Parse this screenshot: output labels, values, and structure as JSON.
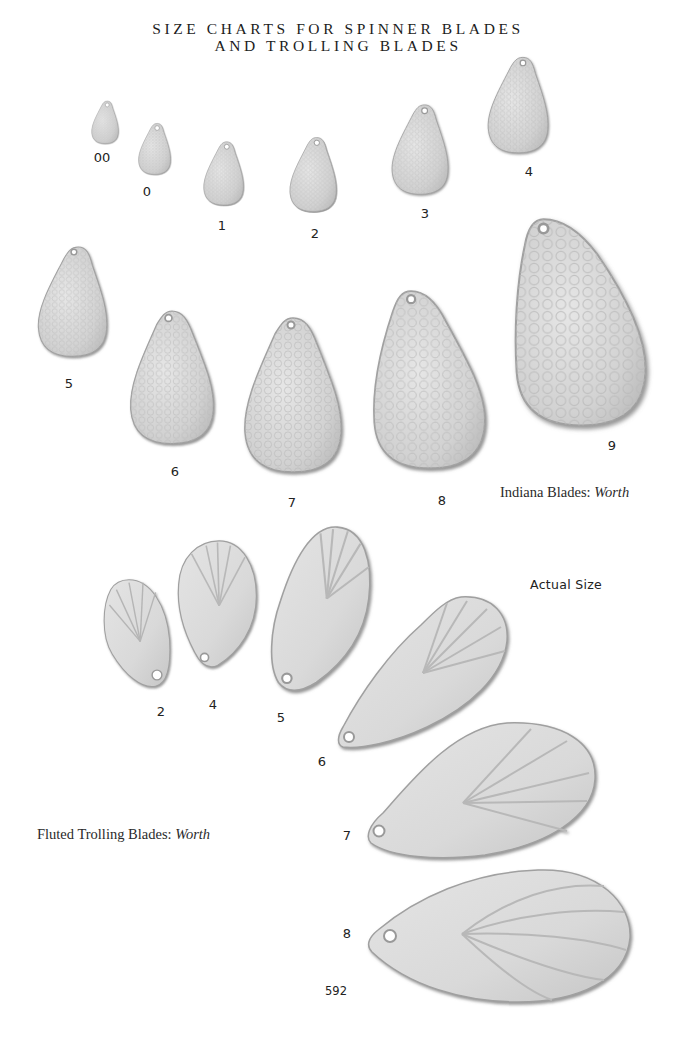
{
  "page": {
    "title_line1": "SIZE CHARTS FOR SPINNER BLADES",
    "title_line2": "AND TROLLING BLADES",
    "page_number": "592",
    "actual_size_note": "Actual Size"
  },
  "indiana_blades": {
    "caption_prefix": "Indiana Blades: ",
    "caption_maker": "Worth",
    "finish": "hammered",
    "sizes": [
      {
        "label": "00"
      },
      {
        "label": "0"
      },
      {
        "label": "1"
      },
      {
        "label": "2"
      },
      {
        "label": "3"
      },
      {
        "label": "4"
      },
      {
        "label": "5"
      },
      {
        "label": "6"
      },
      {
        "label": "7"
      },
      {
        "label": "8"
      },
      {
        "label": "9"
      }
    ]
  },
  "fluted_trolling_blades": {
    "caption_prefix": "Fluted Trolling Blades: ",
    "caption_maker": "Worth",
    "finish": "fluted",
    "sizes": [
      {
        "label": "2"
      },
      {
        "label": "4"
      },
      {
        "label": "5"
      },
      {
        "label": "6"
      },
      {
        "label": "7"
      },
      {
        "label": "8"
      }
    ]
  },
  "colors": {
    "blade_fill": "#d8d8d8",
    "blade_edge": "#9a9a9a",
    "blade_shadow": "#8c8c8c",
    "text": "#222222"
  }
}
